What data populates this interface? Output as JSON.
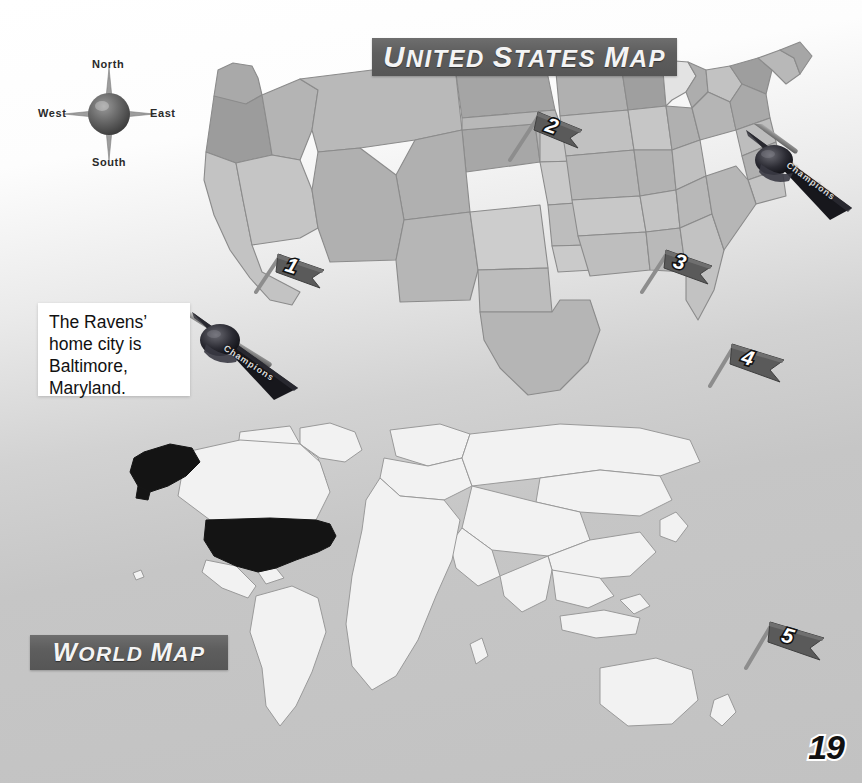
{
  "page": {
    "number": "19",
    "background_color": "#c6c6c6"
  },
  "banners": {
    "us_map": "United States Map",
    "world_map": "World Map",
    "color": "#5e5e5e",
    "text_color": "#f4f4f4"
  },
  "compass": {
    "name": "compass-rose",
    "north": "North",
    "south": "South",
    "west": "West",
    "east": "East"
  },
  "callout": {
    "text": "The Ravens’ home city is Baltimore, Maryland.",
    "background": "#ffffff",
    "text_color": "#111111"
  },
  "us_map": {
    "title": "United States Map",
    "style": "grayscale state outlines",
    "markers": [
      {
        "label": "1",
        "name": "map-flag-1",
        "x": 262,
        "y": 240,
        "rotation": -18
      },
      {
        "label": "2",
        "name": "map-flag-2",
        "x": 530,
        "y": 104,
        "rotation": -22
      },
      {
        "label": "3",
        "name": "map-flag-3",
        "x": 648,
        "y": 238,
        "rotation": -16
      },
      {
        "label": "4",
        "name": "map-flag-4",
        "x": 716,
        "y": 336,
        "rotation": -14
      }
    ],
    "pennants": [
      {
        "name": "pennant-baltimore",
        "word": "Champions",
        "x": 180,
        "y": 300,
        "rotation": 28
      },
      {
        "name": "pennant-northeast",
        "word": "Champions",
        "x": 738,
        "y": 128,
        "rotation": 22
      }
    ]
  },
  "world_map": {
    "title": "World Map",
    "highlighted_country": "United States",
    "highlight_color": "#111111",
    "land_color": "#f2f2f2",
    "markers": [
      {
        "label": "5",
        "name": "map-flag-5",
        "x": 752,
        "y": 612,
        "rotation": -14
      }
    ]
  },
  "flag_style": {
    "fill": "#5b5b5b",
    "pole_color": "#8a8a8a",
    "number_color": "#ffffff",
    "number_outline": "#111111"
  },
  "pennant_style": {
    "fill": "#1c1c1c",
    "text_color": "#d8d8d8"
  }
}
